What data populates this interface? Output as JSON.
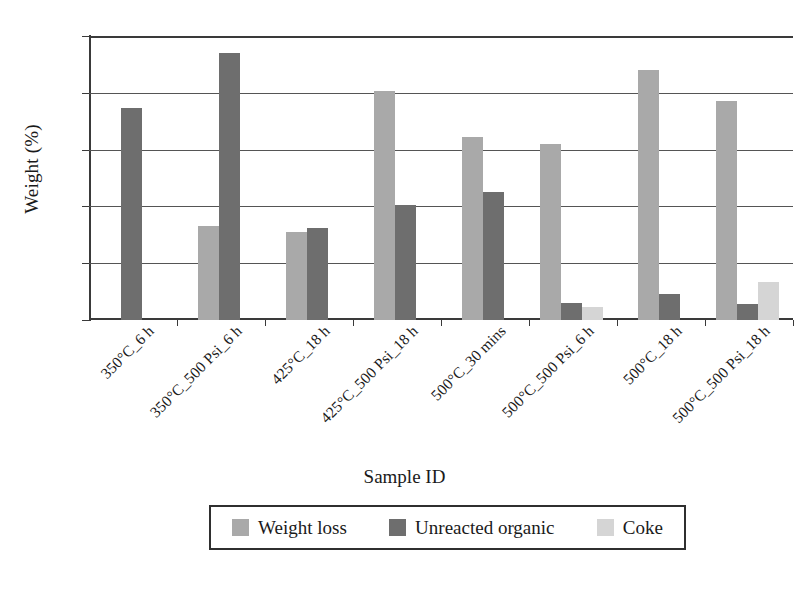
{
  "chart_data": {
    "type": "bar",
    "title": "",
    "xlabel": "Sample ID",
    "ylabel": "Weight (%)",
    "ylim": [
      0,
      10
    ],
    "yticks": [
      0,
      2,
      4,
      6,
      8,
      10
    ],
    "grid": "horizontal",
    "legend_position": "bottom",
    "categories": [
      "350°C_6 h",
      "350°C_500 Psi_6 h",
      "425°C_18 h",
      "425°C_500 Psi_18 h",
      "500°C_30 mins",
      "500°C_500 Psi_6 h",
      "500°C_18 h",
      "500°C_500 Psi_18 h"
    ],
    "series": [
      {
        "name": "Weight loss",
        "color": "#a9a9a9",
        "values": [
          null,
          3.3,
          3.1,
          8.05,
          6.45,
          6.2,
          8.8,
          7.7
        ]
      },
      {
        "name": "Unreacted organic",
        "color": "#6e6e6e",
        "values": [
          7.45,
          9.4,
          3.25,
          4.05,
          4.5,
          0.6,
          0.9,
          0.55
        ]
      },
      {
        "name": "Coke",
        "color": "#d5d5d5",
        "values": [
          null,
          null,
          null,
          null,
          null,
          0.45,
          null,
          1.35
        ]
      }
    ]
  },
  "legend": {
    "items": [
      {
        "label": "Weight loss",
        "color": "#a9a9a9"
      },
      {
        "label": "Unreacted organic",
        "color": "#6e6e6e"
      },
      {
        "label": "Coke",
        "color": "#d5d5d5"
      }
    ]
  },
  "axes": {
    "y_title": "Weight (%)",
    "x_title": "Sample ID",
    "y_tick_labels": [
      "0",
      "2",
      "4",
      "6",
      "8",
      "10"
    ]
  }
}
